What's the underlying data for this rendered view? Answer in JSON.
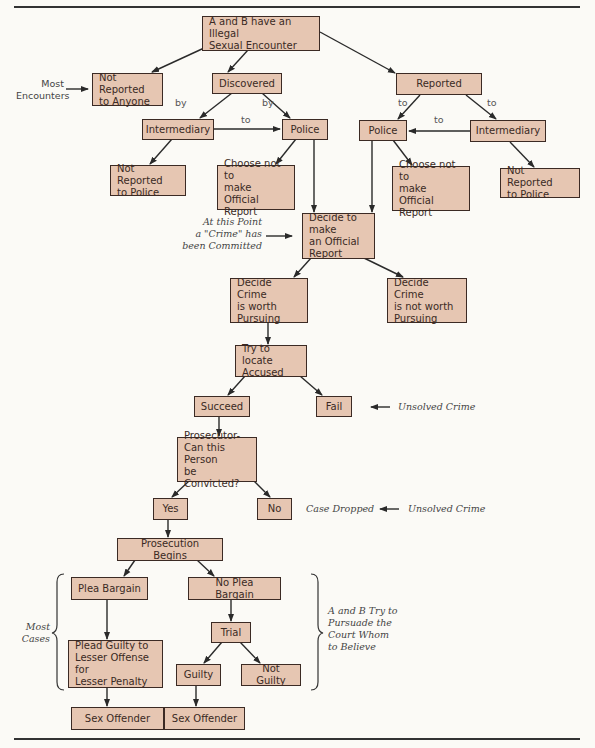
{
  "diagram": {
    "type": "flowchart",
    "nodes": {
      "root": "A and B have an Illegal\nSexual Encounter",
      "not_reported_anyone": "Not Reported\nto Anyone",
      "discovered": "Discovered",
      "reported": "Reported",
      "intermediary_left": "Intermediary",
      "police_left": "Police",
      "police_right": "Police",
      "intermediary_right": "Intermediary",
      "not_reported_police_left": "Not Reported\nto Police",
      "choose_not_left": "Choose not to\nmake Official\nReport",
      "choose_not_right": "Choose not to\nmake Official\nReport",
      "not_reported_police_right": "Not Reported\nto Police",
      "decide_official": "Decide to make\nan Official\nReport",
      "decide_worth": "Decide Crime\nis worth\nPursuing",
      "decide_not_worth": "Decide Crime\nis not worth\nPursuing",
      "try_locate": "Try to locate\nAccused",
      "succeed": "Succeed",
      "fail": "Fail",
      "prosecutor": "Prosecutor-\nCan this Person\nbe Convicted?",
      "yes": "Yes",
      "no": "No",
      "prosecution_begins": "Prosecution Begins",
      "plea_bargain": "Plea Bargain",
      "no_plea_bargain": "No Plea Bargain",
      "trial": "Trial",
      "plead_guilty": "Plead Guilty to\nLesser Offense for\nLesser Penalty",
      "guilty": "Guilty",
      "not_guilty": "Not Guilty",
      "sex_offender_left": "Sex Offender",
      "sex_offender_right": "Sex Offender"
    },
    "edge_labels": {
      "discovered_by_left": "by",
      "discovered_by_right": "by",
      "intermediary_to_police_left": "to",
      "reported_to_left": "to",
      "reported_to_right": "to",
      "intermediary_to_police_right": "to"
    },
    "annotations": {
      "most_encounters": "Most\nEncounters",
      "crime_committed": "At this Point\na \"Crime\" has\nbeen Committed",
      "unsolved_crime_fail": "Unsolved Crime",
      "case_dropped": "Case Dropped",
      "unsolved_crime_no": "Unsolved Crime",
      "most_cases": "Most\nCases",
      "persuade_court": "A and B Try to\nPursuade the\nCourt Whom\nto Believe"
    },
    "colors": {
      "box_fill": "#e6c6b2",
      "box_border": "#3b2a24",
      "line": "#2a2a2a",
      "background": "#fbfaf6"
    }
  }
}
